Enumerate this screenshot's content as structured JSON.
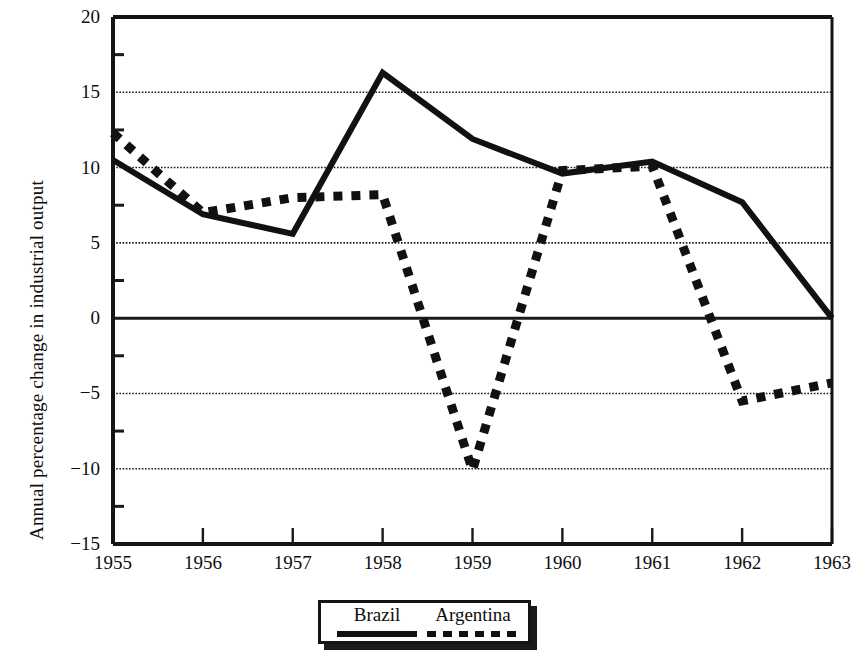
{
  "chart_data": {
    "type": "line",
    "title": "",
    "xlabel": "",
    "ylabel": "Annual percentage change in industrial output",
    "x": [
      "1955",
      "1956",
      "1957",
      "1958",
      "1959",
      "1960",
      "1961",
      "1962",
      "1963"
    ],
    "xtick_labels": [
      "1955",
      "1956",
      "1957",
      "1958",
      "1959",
      "1960",
      "1961",
      "1962",
      "1963"
    ],
    "ytick_labels": [
      "20",
      "15",
      "10",
      "5",
      "0",
      "−5",
      "−10",
      "−15"
    ],
    "ytick_values": [
      20,
      15,
      10,
      5,
      0,
      -5,
      -10,
      -15
    ],
    "ylim": [
      -15,
      20
    ],
    "grid": true,
    "grid_axis": "y",
    "legend_position": "bottom-center",
    "series": [
      {
        "name": "Brazil",
        "style": "solid",
        "color": "#111111",
        "values": [
          10.5,
          6.9,
          5.6,
          16.3,
          11.9,
          9.6,
          10.4,
          7.7,
          0.0
        ]
      },
      {
        "name": "Argentina",
        "style": "dashed",
        "color": "#111111",
        "values": [
          12.3,
          7.0,
          8.0,
          8.2,
          -10.1,
          9.8,
          10.1,
          -5.5,
          -4.3
        ]
      }
    ]
  },
  "legend": {
    "entries": [
      {
        "label": "Brazil",
        "style": "solid"
      },
      {
        "label": "Argentina",
        "style": "dashed"
      }
    ]
  },
  "axes": {
    "y_title": "Annual percentage change in industrial output"
  }
}
